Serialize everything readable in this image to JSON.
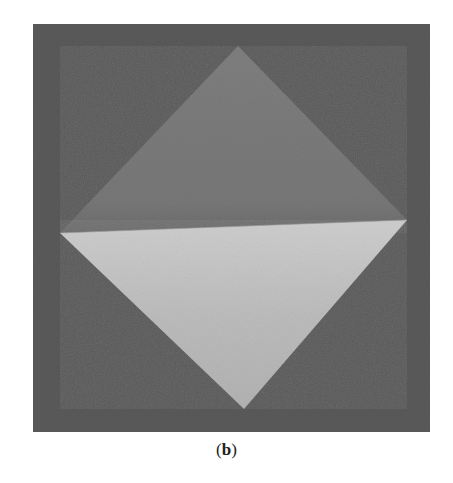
{
  "figure": {
    "caption_open": "(",
    "caption_label": "b",
    "caption_close": ")",
    "photo": {
      "subject": "origami paper square folded diagonally in half (triangle fold) on textured background",
      "background_rect": {
        "x": 33,
        "y": 24,
        "width": 397,
        "height": 408
      },
      "diamond": {
        "top": [
          238,
          46
        ],
        "right": [
          407,
          220
        ],
        "bottom": [
          244,
          409
        ],
        "left": [
          60,
          233
        ]
      },
      "colors": {
        "background": "#5a5a5a",
        "upper_half": "#7a7a7a",
        "lower_half": "#bdbdbd",
        "fold_shadow": "#9a9a9a"
      }
    }
  }
}
